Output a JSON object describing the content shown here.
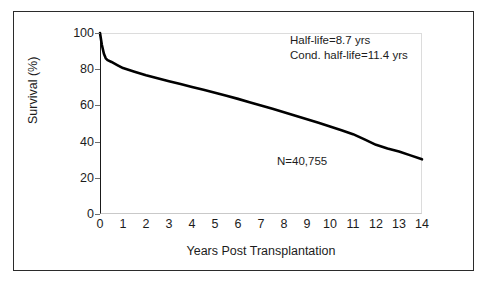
{
  "chart_data": {
    "type": "line",
    "title": "",
    "subtitle": "",
    "xlabel": "Years Post Transplantation",
    "ylabel": "Survival (%)",
    "xlim": [
      0,
      14
    ],
    "ylim": [
      0,
      100
    ],
    "xticks": [
      "0",
      "1",
      "2",
      "3",
      "4",
      "5",
      "6",
      "7",
      "8",
      "9",
      "10",
      "11",
      "12",
      "13",
      "14"
    ],
    "xtick_values": [
      0,
      1,
      2,
      3,
      4,
      5,
      6,
      7,
      8,
      9,
      10,
      11,
      12,
      13,
      14
    ],
    "yticks": [
      "0",
      "20",
      "40",
      "60",
      "80",
      "100"
    ],
    "ytick_values": [
      0,
      20,
      40,
      60,
      80,
      100
    ],
    "grid": false,
    "legend": "none",
    "line_color": "#000000",
    "line_width": 2.6,
    "series": [
      {
        "name": "Survival",
        "x": [
          0,
          0.08,
          0.17,
          0.25,
          0.33,
          0.5,
          0.75,
          1,
          1.5,
          2,
          2.5,
          3,
          3.5,
          4,
          4.5,
          5,
          5.5,
          6,
          6.5,
          7,
          7.5,
          8,
          8.5,
          9,
          9.5,
          10,
          10.5,
          11,
          11.5,
          12,
          12.5,
          13,
          13.5,
          14
        ],
        "y": [
          100,
          93.5,
          88.5,
          86,
          85,
          84,
          82.3,
          80.6,
          78.6,
          76.7,
          75,
          73.4,
          71.8,
          70.2,
          68.6,
          67,
          65.3,
          63.6,
          61.8,
          60,
          58.1,
          56.2,
          54.3,
          52.4,
          50.4,
          48.4,
          46.3,
          44.1,
          41.2,
          38.2,
          36.2,
          34.5,
          32.4,
          30.2
        ]
      }
    ],
    "annotations": [
      {
        "name": "half-life",
        "lines": [
          "Half-life=8.7 yrs",
          "Cond. half-life=11.4 yrs"
        ]
      },
      {
        "name": "sample-size",
        "text": "N=40,755"
      }
    ]
  }
}
